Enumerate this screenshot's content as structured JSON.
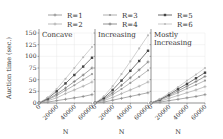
{
  "chart_data": [
    {
      "type": "line",
      "title": "Concave",
      "xlabel": "N",
      "ylabel": "Auction time (sec.)",
      "x": [
        0,
        10000,
        20000,
        30000,
        40000,
        50000,
        60000
      ],
      "xticks": [
        "0",
        "20000",
        "40000",
        "60000"
      ],
      "yticks": [
        "0",
        "25",
        "50",
        "75",
        "100",
        "125",
        "150"
      ],
      "ylim": [
        0,
        150
      ],
      "xlim": [
        0,
        60000
      ],
      "grid": true,
      "series": [
        {
          "name": "R=1",
          "values": [
            0,
            2,
            5,
            8,
            11,
            14,
            18
          ]
        },
        {
          "name": "R=2",
          "values": [
            0,
            5,
            11,
            20,
            28,
            36,
            45
          ]
        },
        {
          "name": "R=3",
          "values": [
            0,
            7,
            16,
            27,
            38,
            50,
            62
          ]
        },
        {
          "name": "R=4",
          "values": [
            0,
            8,
            19,
            32,
            46,
            60,
            75
          ]
        },
        {
          "name": "R=5",
          "values": [
            0,
            10,
            25,
            42,
            60,
            78,
            97
          ]
        },
        {
          "name": "R=6",
          "values": [
            0,
            12,
            30,
            52,
            75,
            98,
            120
          ]
        }
      ]
    },
    {
      "type": "line",
      "title": "Increasing",
      "xlabel": "N",
      "ylabel": "",
      "x": [
        0,
        10000,
        20000,
        30000,
        40000,
        50000,
        60000
      ],
      "xticks": [
        "0",
        "20000",
        "40000",
        "60000"
      ],
      "ylim": [
        0,
        150
      ],
      "xlim": [
        0,
        60000
      ],
      "grid": true,
      "series": [
        {
          "name": "R=1",
          "values": [
            0,
            2,
            6,
            10,
            14,
            18,
            22
          ]
        },
        {
          "name": "R=2",
          "values": [
            0,
            5,
            12,
            20,
            28,
            36,
            45
          ]
        },
        {
          "name": "R=3",
          "values": [
            0,
            7,
            18,
            30,
            43,
            56,
            70
          ]
        },
        {
          "name": "R=4",
          "values": [
            0,
            9,
            22,
            38,
            54,
            71,
            88
          ]
        },
        {
          "name": "R=5",
          "values": [
            0,
            11,
            28,
            48,
            69,
            90,
            112
          ]
        },
        {
          "name": "R=6",
          "values": [
            0,
            14,
            36,
            62,
            89,
            117,
            145
          ]
        }
      ]
    },
    {
      "type": "line",
      "title": "Mostly Increasing",
      "xlabel": "N",
      "ylabel": "",
      "x": [
        0,
        10000,
        20000,
        30000,
        40000,
        50000,
        60000
      ],
      "xticks": [
        "0",
        "20000",
        "40000",
        "60000"
      ],
      "ylim": [
        0,
        150
      ],
      "xlim": [
        0,
        60000
      ],
      "grid": true,
      "series": [
        {
          "name": "R=1",
          "values": [
            0,
            2,
            5,
            8,
            11,
            14,
            18
          ]
        },
        {
          "name": "R=2",
          "values": [
            0,
            4,
            10,
            16,
            22,
            28,
            35
          ]
        },
        {
          "name": "R=3",
          "values": [
            0,
            6,
            14,
            22,
            31,
            39,
            48
          ]
        },
        {
          "name": "R=4",
          "values": [
            0,
            7,
            16,
            26,
            36,
            46,
            57
          ]
        },
        {
          "name": "R=5",
          "values": [
            0,
            8,
            18,
            30,
            41,
            53,
            65
          ]
        },
        {
          "name": "R=6",
          "values": [
            0,
            9,
            21,
            34,
            48,
            61,
            75
          ]
        }
      ]
    }
  ],
  "legend": {
    "position": "top",
    "items": [
      {
        "label": "R=1",
        "color": "#888888",
        "marker": "plus"
      },
      {
        "label": "R=2",
        "color": "#aaaaaa",
        "marker": "plus"
      },
      {
        "label": "R=3",
        "color": "#999999",
        "marker": "circle"
      },
      {
        "label": "R=4",
        "color": "#777777",
        "marker": "plus"
      },
      {
        "label": "R=5",
        "color": "#444444",
        "marker": "square"
      },
      {
        "label": "R=6",
        "color": "#bbbbbb",
        "marker": "circle"
      }
    ]
  },
  "labels": {
    "ylabel": "Auction time (sec.)",
    "xlabel": "N",
    "panel_titles": [
      "Concave",
      "Increasing",
      "Mostly",
      "Increasing"
    ]
  }
}
